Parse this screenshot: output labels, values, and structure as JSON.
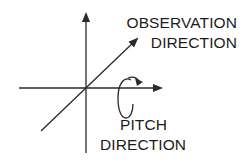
{
  "diagram": {
    "type": "coordinate-axes-with-rotation",
    "colors": {
      "line": "#2a2a2a",
      "text": "#1c1c1c",
      "background": "#ffffff"
    },
    "axes": {
      "vertical": {
        "from": [
          86,
          153
        ],
        "to": [
          86,
          12
        ],
        "arrow": "up"
      },
      "horizontal": {
        "from": [
          19,
          88
        ],
        "to": [
          163,
          88
        ],
        "arrow": "right"
      },
      "diagonal": {
        "from": [
          41,
          131
        ],
        "to": [
          138,
          38
        ],
        "arrow": "up-right"
      }
    },
    "rotation_indicator": {
      "shape": "ellipse-with-arrow",
      "center": [
        125,
        98
      ],
      "arrow_direction": "clockwise-top"
    },
    "labels": {
      "observation": {
        "line1": "OBSERVATION",
        "line2": "DIRECTION"
      },
      "pitch": {
        "line1": "PITCH",
        "line2": "DIRECTION"
      }
    }
  }
}
